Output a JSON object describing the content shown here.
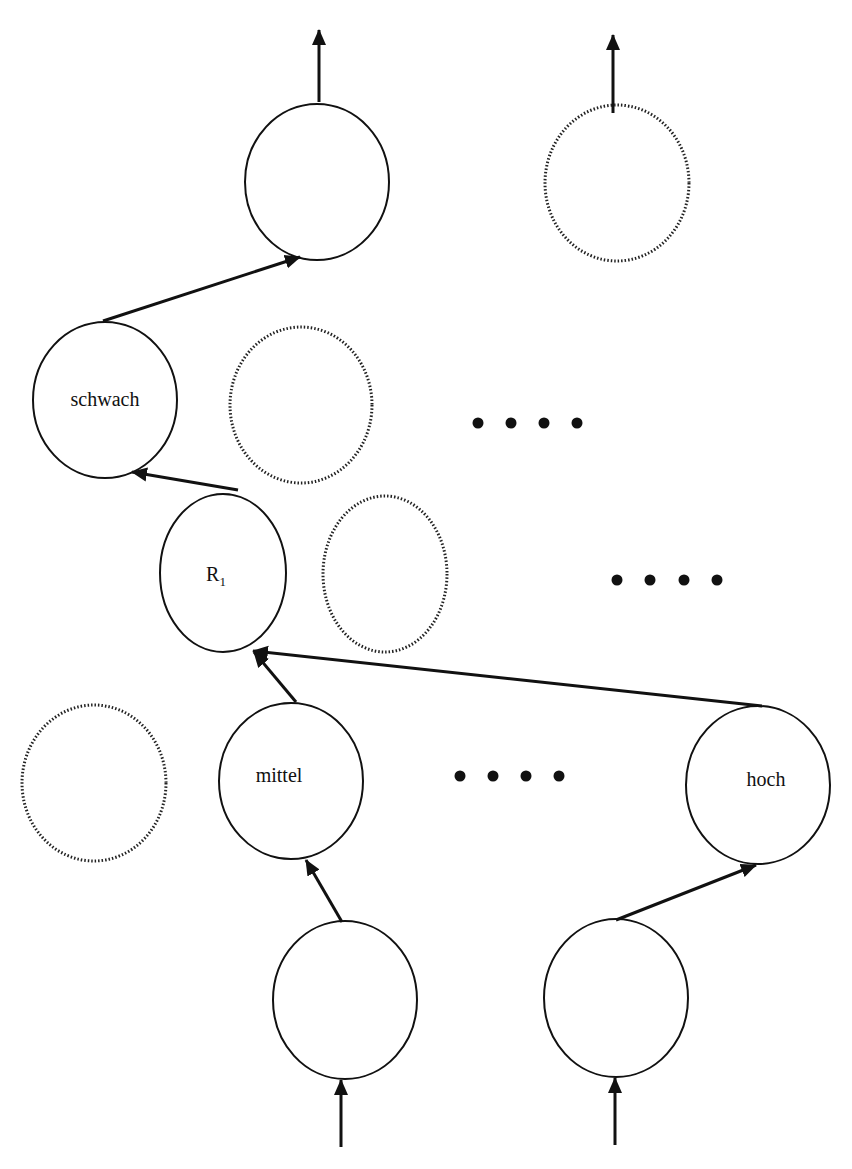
{
  "diagram": {
    "type": "layered-network",
    "colors": {
      "stroke": "#111111",
      "background": "#ffffff"
    },
    "nodes": [
      {
        "id": "out1",
        "label": "",
        "style": "solid",
        "cx": 317,
        "cy": 182
      },
      {
        "id": "out2",
        "label": "",
        "style": "dotted",
        "cx": 617,
        "cy": 183
      },
      {
        "id": "schwach",
        "label": "schwach",
        "style": "solid",
        "cx": 105,
        "cy": 400
      },
      {
        "id": "l3b",
        "label": "",
        "style": "dotted",
        "cx": 301,
        "cy": 405
      },
      {
        "id": "r1",
        "label": "R",
        "sub": "1",
        "style": "solid",
        "cx": 223,
        "cy": 573
      },
      {
        "id": "l2b",
        "label": "",
        "style": "dotted",
        "cx": 385,
        "cy": 574
      },
      {
        "id": "l1a",
        "label": "",
        "style": "dotted",
        "cx": 94,
        "cy": 783
      },
      {
        "id": "mittel",
        "label": "mittel",
        "style": "solid",
        "cx": 291,
        "cy": 781
      },
      {
        "id": "hoch",
        "label": "hoch",
        "style": "solid",
        "cx": 758,
        "cy": 785
      },
      {
        "id": "in1",
        "label": "",
        "style": "solid",
        "cx": 345,
        "cy": 1000
      },
      {
        "id": "in2",
        "label": "",
        "style": "solid",
        "cx": 616,
        "cy": 998
      }
    ],
    "ellipsis": [
      {
        "text": "....",
        "row": "schwach-layer"
      },
      {
        "text": "....",
        "row": "r1-layer"
      },
      {
        "text": "....",
        "row": "mittel-layer"
      }
    ],
    "labels": {
      "schwach": "schwach",
      "r1_main": "R",
      "r1_sub": "1",
      "mittel": "mittel",
      "hoch": "hoch"
    }
  }
}
